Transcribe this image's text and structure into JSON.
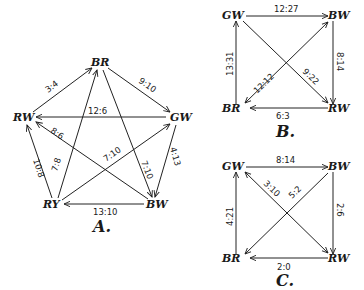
{
  "diagrams": [
    {
      "caption": "A.",
      "nodes": [
        {
          "id": "BR",
          "label": "BR",
          "x": 100,
          "y": 63
        },
        {
          "id": "GW",
          "label": "GW",
          "x": 178,
          "y": 118
        },
        {
          "id": "BW",
          "label": "BW",
          "x": 152,
          "y": 205
        },
        {
          "id": "RY",
          "label": "RY",
          "x": 55,
          "y": 205
        },
        {
          "id": "RW",
          "label": "RW",
          "x": 25,
          "y": 118
        }
      ],
      "edges": [
        {
          "from": "RW",
          "to": "BR",
          "label": "3:4"
        },
        {
          "from": "BR",
          "to": "GW",
          "label": "9:10"
        },
        {
          "from": "GW",
          "to": "RW",
          "label": "12:6"
        },
        {
          "from": "BW",
          "to": "RW",
          "label": "8:6"
        },
        {
          "from": "RY",
          "to": "RW",
          "label": "10:8"
        },
        {
          "from": "RY",
          "to": "BR",
          "label": "7:8"
        },
        {
          "from": "RY",
          "to": "GW",
          "label": "7:10"
        },
        {
          "from": "BR",
          "to": "BW",
          "label": "7:10"
        },
        {
          "from": "GW",
          "to": "BW",
          "label": "4:13"
        },
        {
          "from": "BW",
          "to": "RY",
          "label": "13:10"
        }
      ]
    },
    {
      "caption": "B.",
      "nodes": [
        {
          "id": "GW",
          "label": "GW",
          "x": 237,
          "y": 15
        },
        {
          "id": "BW",
          "label": "BW",
          "x": 332,
          "y": 15
        },
        {
          "id": "RW",
          "label": "RW",
          "x": 332,
          "y": 108
        },
        {
          "id": "BR",
          "label": "BR",
          "x": 237,
          "y": 108
        }
      ],
      "edges": [
        {
          "from": "GW",
          "to": "BW",
          "label": "12:27"
        },
        {
          "from": "BW",
          "to": "RW",
          "label": "8:14"
        },
        {
          "from": "RW",
          "to": "BR",
          "label": "6:3"
        },
        {
          "from": "BR",
          "to": "GW",
          "label": "13:31"
        },
        {
          "from": "GW",
          "to": "RW",
          "label": "9:22"
        },
        {
          "from": "BR",
          "to": "BW",
          "label": "12:12",
          "bidirectional": true
        }
      ]
    },
    {
      "caption": "C.",
      "nodes": [
        {
          "id": "GW",
          "label": "GW",
          "x": 237,
          "y": 166
        },
        {
          "id": "BW",
          "label": "BW",
          "x": 332,
          "y": 166
        },
        {
          "id": "RW",
          "label": "RW",
          "x": 332,
          "y": 258
        },
        {
          "id": "BR",
          "label": "BR",
          "x": 237,
          "y": 258
        }
      ],
      "edges": [
        {
          "from": "GW",
          "to": "BW",
          "label": "8:14"
        },
        {
          "from": "BW",
          "to": "RW",
          "label": "2:6"
        },
        {
          "from": "RW",
          "to": "BR",
          "label": "2:0"
        },
        {
          "from": "BR",
          "to": "GW",
          "label": "4:21"
        },
        {
          "from": "GW",
          "to": "RW",
          "label": "3:10",
          "bidirectional": true
        },
        {
          "from": "BW",
          "to": "BR",
          "label": "5:2"
        }
      ]
    }
  ]
}
